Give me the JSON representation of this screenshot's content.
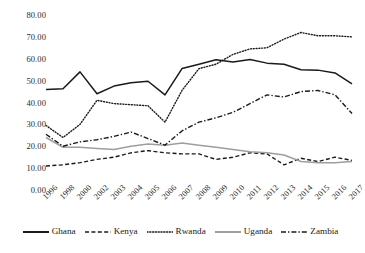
{
  "chart_data": {
    "type": "line",
    "title": "",
    "xlabel": "",
    "ylabel": "",
    "ylim": [
      0,
      80
    ],
    "ytick_step": 10,
    "grid": false,
    "legend_position": "bottom",
    "ytick_labels": [
      "80.00",
      "70.00",
      "60.00",
      "50.00",
      "40.00",
      "30.00",
      "20.00",
      "10.00",
      "0.00"
    ],
    "categories": [
      "1996",
      "1998",
      "2000",
      "2002",
      "2003",
      "2004",
      "2005",
      "2006",
      "2007",
      "2008",
      "2009",
      "2010",
      "2011",
      "2012",
      "2013",
      "2014",
      "2015",
      "2016",
      "2017"
    ],
    "series": [
      {
        "name": "Ghana",
        "style": "solid",
        "color": "#1a1a1a",
        "values": [
          46.0,
          46.3,
          54.0,
          44.0,
          47.5,
          49.0,
          49.7,
          43.5,
          55.5,
          57.5,
          59.5,
          58.5,
          59.7,
          58.0,
          57.5,
          55.0,
          54.8,
          53.5,
          48.5
        ]
      },
      {
        "name": "Kenya",
        "style": "dashed",
        "color": "#1a1a1a",
        "values": [
          11.0,
          11.5,
          12.5,
          14.0,
          15.0,
          17.0,
          18.0,
          17.0,
          16.5,
          16.5,
          14.0,
          15.0,
          17.0,
          16.5,
          11.5,
          14.5,
          13.0,
          15.0,
          13.5
        ]
      },
      {
        "name": "Rwanda",
        "style": "dotted",
        "color": "#1a1a1a",
        "values": [
          29.5,
          24.0,
          30.0,
          41.0,
          39.5,
          39.0,
          38.5,
          31.0,
          45.5,
          55.5,
          57.5,
          62.0,
          64.5,
          65.0,
          69.0,
          72.0,
          70.5,
          70.5,
          70.0
        ]
      },
      {
        "name": "Uganda",
        "style": "solid",
        "color": "#9e9e9e",
        "values": [
          24.0,
          19.5,
          19.5,
          19.0,
          18.5,
          20.0,
          21.0,
          20.5,
          21.5,
          20.5,
          19.5,
          18.5,
          17.5,
          17.0,
          16.0,
          13.0,
          12.5,
          12.5,
          13.0
        ]
      },
      {
        "name": "Zambia",
        "style": "dashdot",
        "color": "#1a1a1a",
        "values": [
          25.5,
          20.0,
          22.0,
          23.0,
          24.5,
          26.5,
          23.5,
          20.5,
          27.0,
          31.0,
          33.0,
          35.5,
          39.5,
          43.5,
          42.5,
          45.0,
          45.5,
          43.5,
          35.0
        ]
      }
    ]
  },
  "legend": {
    "items": [
      {
        "label": "Ghana"
      },
      {
        "label": "Kenya"
      },
      {
        "label": "Rwanda"
      },
      {
        "label": "Uganda"
      },
      {
        "label": "Zambia"
      }
    ]
  }
}
